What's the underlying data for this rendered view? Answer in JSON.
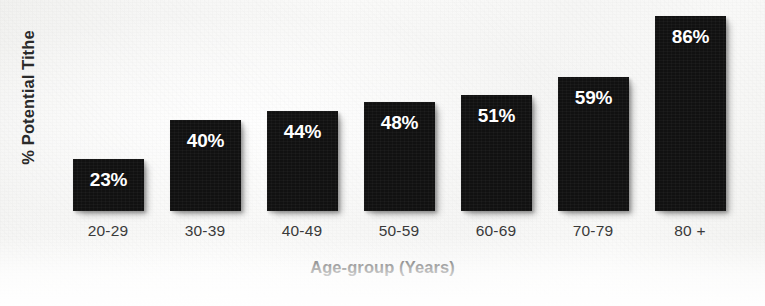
{
  "chart_data": {
    "type": "bar",
    "title": "",
    "subtitle": "",
    "xlabel": "Age-group (Years)",
    "ylabel": "% Potential Tithe",
    "categories": [
      "20-29",
      "30-39",
      "40-49",
      "50-59",
      "60-69",
      "70-79",
      "80 +"
    ],
    "values": [
      23,
      40,
      44,
      48,
      51,
      59,
      86
    ],
    "data_labels": [
      "23%",
      "40%",
      "44%",
      "48%",
      "51%",
      "59%",
      "86%"
    ],
    "ylim": [
      0,
      93
    ],
    "grid": false,
    "legend": null,
    "legend_position": "none",
    "bar_color": "#111111",
    "label_color": "#FFFFFF",
    "axis_text_color": "#2A2A2A",
    "background_color": "#F7F7F6",
    "axis_tick_labels_y": [],
    "annotations": []
  },
  "figure": {
    "y_axis_title": "% Potential Tithe",
    "x_axis_title": "Age-group (Years)"
  }
}
